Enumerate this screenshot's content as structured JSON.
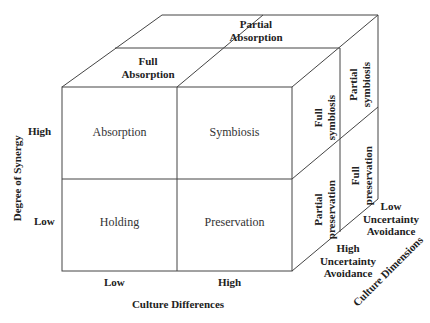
{
  "diagram": {
    "type": "3d-cube-matrix",
    "front_face": {
      "cells": [
        {
          "row": "High",
          "col": "Low",
          "label": "Absorption"
        },
        {
          "row": "High",
          "col": "High",
          "label": "Symbiosis"
        },
        {
          "row": "Low",
          "col": "Low",
          "label": "Holding"
        },
        {
          "row": "Low",
          "col": "High",
          "label": "Preservation"
        }
      ]
    },
    "top_face": {
      "front_label": [
        "Full",
        "Absorption"
      ],
      "back_label": [
        "Partial",
        "Absorption"
      ]
    },
    "right_face": {
      "top_front": [
        "Full",
        "symbiosis"
      ],
      "top_back": [
        "Partial",
        "symbiosis"
      ],
      "bottom_front": [
        "Partial",
        "preservation"
      ],
      "bottom_back": [
        "Full",
        "preservation"
      ]
    },
    "axes": {
      "y": {
        "title": "Degree of Synergy",
        "ticks": [
          "High",
          "Low"
        ]
      },
      "x": {
        "title": "Culture Differences",
        "ticks": [
          "Low",
          "High"
        ]
      },
      "z": {
        "title": "Culture Dimensions",
        "ticks": [
          [
            "High",
            "Uncertainty",
            "Avoidance"
          ],
          [
            "Low",
            "Uncertainty",
            "Avoidance"
          ]
        ]
      }
    }
  }
}
